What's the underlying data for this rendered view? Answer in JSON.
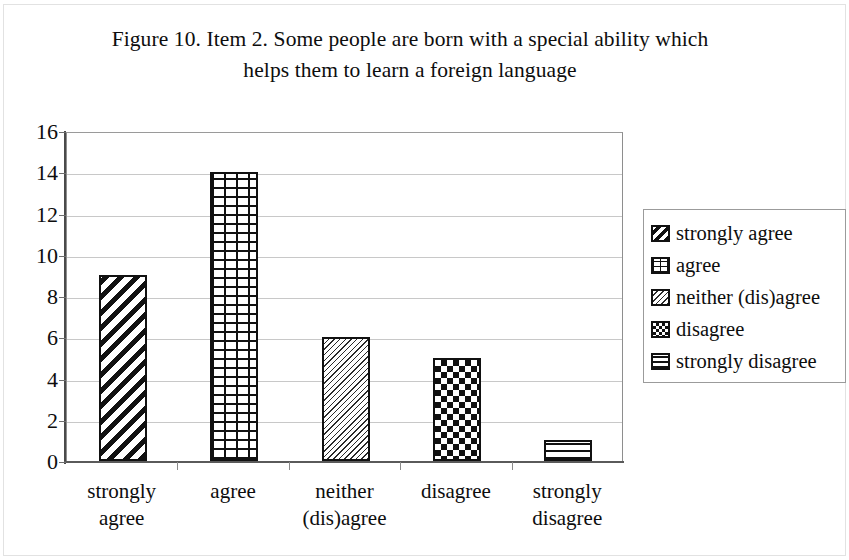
{
  "figure": {
    "title_line1": "Figure 10. Item 2. Some people are born with a special ability which",
    "title_line2": "helps them to learn a foreign language"
  },
  "chart_data": {
    "type": "bar",
    "title": "Figure 10. Item 2. Some people are born with a special ability which helps them to learn a foreign language",
    "categories": [
      "strongly agree",
      "agree",
      "neither (dis)agree",
      "disagree",
      "strongly disagree"
    ],
    "category_lines": [
      [
        "strongly",
        "agree"
      ],
      [
        "agree",
        ""
      ],
      [
        "neither",
        "(dis)agree"
      ],
      [
        "disagree",
        ""
      ],
      [
        "strongly",
        "disagree"
      ]
    ],
    "values": [
      9,
      14,
      6,
      5,
      1
    ],
    "xlabel": "",
    "ylabel": "",
    "ylim": [
      0,
      16
    ],
    "ytick_step": 2,
    "yticks": [
      0,
      2,
      4,
      6,
      8,
      10,
      12,
      14,
      16
    ],
    "ytick_labels": [
      "0",
      "2",
      "4",
      "6",
      "8",
      "10",
      "12",
      "14",
      "16"
    ],
    "grid": true,
    "grid_axis": "y",
    "legend_position": "right",
    "bar_patterns": [
      "diagonal-wide",
      "brick",
      "diagonal-fine",
      "checkerboard",
      "horizontal-lines"
    ],
    "colors": {
      "bar_fill": "#ffffff",
      "bar_outline": "#111111",
      "gridline": "#c8c8c8",
      "axis": "#4a4a4a",
      "text": "#0d0d0d"
    }
  },
  "legend": {
    "items": [
      {
        "label": "strongly agree",
        "pattern": "diagonal-wide"
      },
      {
        "label": "agree",
        "pattern": "brick"
      },
      {
        "label": "neither (dis)agree",
        "pattern": "diagonal-fine"
      },
      {
        "label": "disagree",
        "pattern": "checkerboard"
      },
      {
        "label": "strongly disagree",
        "pattern": "horizontal-lines"
      }
    ]
  }
}
